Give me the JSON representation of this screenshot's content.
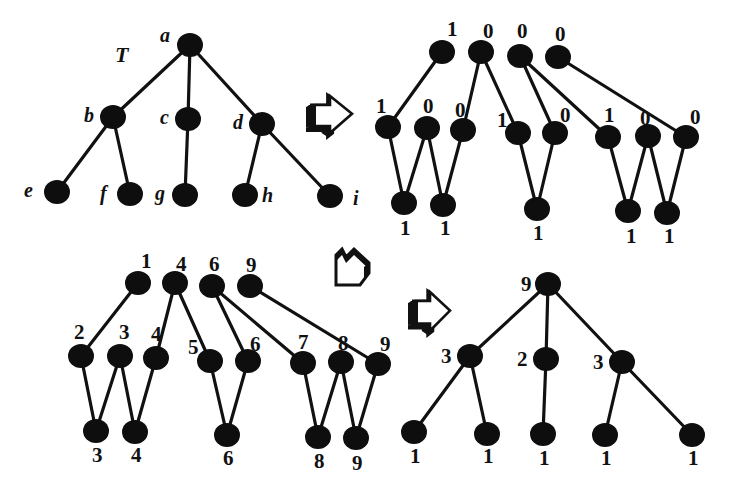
{
  "diagram": {
    "colors": {
      "node": "#0e0e0e",
      "edge": "#111111",
      "background": "#ffffff"
    },
    "node_radius": 12,
    "panels": [
      {
        "id": "tree-T",
        "title": "T",
        "title_pos": [
          115,
          62
        ],
        "label_style": "italic",
        "nodes": [
          {
            "id": "a",
            "x": 190,
            "y": 45,
            "label": "a",
            "lx": 160,
            "ly": 42
          },
          {
            "id": "b",
            "x": 113,
            "y": 117,
            "label": "b",
            "lx": 84,
            "ly": 122
          },
          {
            "id": "c",
            "x": 188,
            "y": 119,
            "label": "c",
            "lx": 160,
            "ly": 124
          },
          {
            "id": "d",
            "x": 262,
            "y": 124,
            "label": "d",
            "lx": 233,
            "ly": 129
          },
          {
            "id": "e",
            "x": 57,
            "y": 192,
            "label": "e",
            "lx": 24,
            "ly": 197
          },
          {
            "id": "f",
            "x": 130,
            "y": 194,
            "label": "f",
            "lx": 100,
            "ly": 200
          },
          {
            "id": "g",
            "x": 185,
            "y": 195,
            "label": "g",
            "lx": 155,
            "ly": 200
          },
          {
            "id": "h",
            "x": 245,
            "y": 195,
            "label": "h",
            "lx": 262,
            "ly": 202
          },
          {
            "id": "i",
            "x": 330,
            "y": 196,
            "label": "i",
            "lx": 353,
            "ly": 205
          }
        ],
        "edges": [
          [
            "a",
            "b"
          ],
          [
            "a",
            "c"
          ],
          [
            "a",
            "d"
          ],
          [
            "b",
            "e"
          ],
          [
            "b",
            "f"
          ],
          [
            "c",
            "g"
          ],
          [
            "d",
            "h"
          ],
          [
            "d",
            "i"
          ]
        ]
      },
      {
        "id": "binary-marks",
        "label_style": "bold",
        "nodes": [
          {
            "id": "t1",
            "x": 442,
            "y": 52,
            "label": "1",
            "lx": 447,
            "ly": 36
          },
          {
            "id": "t2",
            "x": 481,
            "y": 52,
            "label": "0",
            "lx": 483,
            "ly": 38
          },
          {
            "id": "t3",
            "x": 520,
            "y": 56,
            "label": "0",
            "lx": 517,
            "ly": 38
          },
          {
            "id": "t4",
            "x": 558,
            "y": 57,
            "label": "0",
            "lx": 555,
            "ly": 41
          },
          {
            "id": "m1",
            "x": 388,
            "y": 127,
            "label": "1",
            "lx": 376,
            "ly": 113
          },
          {
            "id": "m2",
            "x": 427,
            "y": 128,
            "label": "0",
            "lx": 423,
            "ly": 113
          },
          {
            "id": "m3",
            "x": 463,
            "y": 130,
            "label": "0",
            "lx": 455,
            "ly": 117
          },
          {
            "id": "m4",
            "x": 518,
            "y": 133,
            "label": "1",
            "lx": 497,
            "ly": 127
          },
          {
            "id": "m5",
            "x": 555,
            "y": 133,
            "label": "0",
            "lx": 560,
            "ly": 122
          },
          {
            "id": "m6",
            "x": 608,
            "y": 137,
            "label": "1",
            "lx": 604,
            "ly": 122
          },
          {
            "id": "m7",
            "x": 648,
            "y": 136,
            "label": "0",
            "lx": 640,
            "ly": 125
          },
          {
            "id": "m8",
            "x": 686,
            "y": 137,
            "label": "0",
            "lx": 690,
            "ly": 124
          },
          {
            "id": "b1",
            "x": 404,
            "y": 203,
            "label": "1",
            "lx": 400,
            "ly": 235
          },
          {
            "id": "b2",
            "x": 443,
            "y": 205,
            "label": "1",
            "lx": 440,
            "ly": 235
          },
          {
            "id": "b3",
            "x": 537,
            "y": 209,
            "label": "1",
            "lx": 533,
            "ly": 240
          },
          {
            "id": "b4",
            "x": 628,
            "y": 211,
            "label": "1",
            "lx": 626,
            "ly": 243
          },
          {
            "id": "b5",
            "x": 667,
            "y": 213,
            "label": "1",
            "lx": 664,
            "ly": 243
          }
        ],
        "edges": [
          [
            "t1",
            "m1"
          ],
          [
            "t2",
            "m3"
          ],
          [
            "t2",
            "m4"
          ],
          [
            "t3",
            "m5"
          ],
          [
            "t3",
            "m6"
          ],
          [
            "t4",
            "m8"
          ],
          [
            "m1",
            "b1"
          ],
          [
            "m2",
            "b1"
          ],
          [
            "m2",
            "b2"
          ],
          [
            "m3",
            "b2"
          ],
          [
            "m4",
            "b3"
          ],
          [
            "m5",
            "b3"
          ],
          [
            "m6",
            "b4"
          ],
          [
            "m7",
            "b4"
          ],
          [
            "m7",
            "b5"
          ],
          [
            "m8",
            "b5"
          ]
        ]
      },
      {
        "id": "prefix-sums",
        "label_style": "bold",
        "nodes": [
          {
            "id": "t1",
            "x": 138,
            "y": 283,
            "label": "1",
            "lx": 141,
            "ly": 268
          },
          {
            "id": "t2",
            "x": 175,
            "y": 283,
            "label": "4",
            "lx": 176,
            "ly": 271
          },
          {
            "id": "t3",
            "x": 212,
            "y": 286,
            "label": "6",
            "lx": 209,
            "ly": 271
          },
          {
            "id": "t4",
            "x": 250,
            "y": 286,
            "label": "9",
            "lx": 246,
            "ly": 272
          },
          {
            "id": "m1",
            "x": 81,
            "y": 356,
            "label": "2",
            "lx": 74,
            "ly": 339
          },
          {
            "id": "m2",
            "x": 120,
            "y": 356,
            "label": "3",
            "lx": 119,
            "ly": 339
          },
          {
            "id": "m3",
            "x": 156,
            "y": 358,
            "label": "4",
            "lx": 151,
            "ly": 341
          },
          {
            "id": "m4",
            "x": 210,
            "y": 361,
            "label": "5",
            "lx": 188,
            "ly": 354
          },
          {
            "id": "m5",
            "x": 248,
            "y": 361,
            "label": "6",
            "lx": 250,
            "ly": 351
          },
          {
            "id": "m6",
            "x": 303,
            "y": 363,
            "label": "7",
            "lx": 298,
            "ly": 349
          },
          {
            "id": "m7",
            "x": 341,
            "y": 362,
            "label": "8",
            "lx": 338,
            "ly": 350
          },
          {
            "id": "m8",
            "x": 378,
            "y": 364,
            "label": "9",
            "lx": 380,
            "ly": 351
          },
          {
            "id": "b1",
            "x": 96,
            "y": 431,
            "label": "3",
            "lx": 92,
            "ly": 462
          },
          {
            "id": "b2",
            "x": 135,
            "y": 432,
            "label": "4",
            "lx": 131,
            "ly": 462
          },
          {
            "id": "b3",
            "x": 227,
            "y": 435,
            "label": "6",
            "lx": 223,
            "ly": 465
          },
          {
            "id": "b4",
            "x": 318,
            "y": 437,
            "label": "8",
            "lx": 314,
            "ly": 468
          },
          {
            "id": "b5",
            "x": 356,
            "y": 438,
            "label": "9",
            "lx": 352,
            "ly": 470
          }
        ],
        "edges": [
          [
            "t1",
            "m1"
          ],
          [
            "t2",
            "m3"
          ],
          [
            "t2",
            "m4"
          ],
          [
            "t3",
            "m5"
          ],
          [
            "t3",
            "m6"
          ],
          [
            "t4",
            "m8"
          ],
          [
            "m1",
            "b1"
          ],
          [
            "m2",
            "b1"
          ],
          [
            "m2",
            "b2"
          ],
          [
            "m3",
            "b2"
          ],
          [
            "m4",
            "b3"
          ],
          [
            "m5",
            "b3"
          ],
          [
            "m6",
            "b4"
          ],
          [
            "m7",
            "b4"
          ],
          [
            "m7",
            "b5"
          ],
          [
            "m8",
            "b5"
          ]
        ]
      },
      {
        "id": "subtree-sizes",
        "label_style": "bold",
        "nodes": [
          {
            "id": "r",
            "x": 548,
            "y": 284,
            "label": "9",
            "lx": 521,
            "ly": 291
          },
          {
            "id": "x1",
            "x": 470,
            "y": 356,
            "label": "3",
            "lx": 441,
            "ly": 363
          },
          {
            "id": "x2",
            "x": 546,
            "y": 359,
            "label": "2",
            "lx": 517,
            "ly": 366
          },
          {
            "id": "x3",
            "x": 622,
            "y": 362,
            "label": "3",
            "lx": 593,
            "ly": 369
          },
          {
            "id": "l1",
            "x": 414,
            "y": 432,
            "label": "1",
            "lx": 410,
            "ly": 463
          },
          {
            "id": "l2",
            "x": 487,
            "y": 434,
            "label": "1",
            "lx": 483,
            "ly": 463
          },
          {
            "id": "l3",
            "x": 543,
            "y": 434,
            "label": "1",
            "lx": 539,
            "ly": 465
          },
          {
            "id": "l4",
            "x": 605,
            "y": 435,
            "label": "1",
            "lx": 601,
            "ly": 465
          },
          {
            "id": "l5",
            "x": 692,
            "y": 435,
            "label": "1",
            "lx": 688,
            "ly": 465
          }
        ],
        "edges": [
          [
            "r",
            "x1"
          ],
          [
            "r",
            "x2"
          ],
          [
            "r",
            "x3"
          ],
          [
            "x1",
            "l1"
          ],
          [
            "x1",
            "l2"
          ],
          [
            "x2",
            "l3"
          ],
          [
            "x3",
            "l4"
          ],
          [
            "x3",
            "l5"
          ]
        ]
      }
    ],
    "arrows": [
      {
        "id": "arrow-1",
        "direction": "right",
        "x": 306,
        "y": 93,
        "w": 48,
        "h": 46
      },
      {
        "id": "arrow-2",
        "direction": "down-left",
        "x": 332,
        "y": 245,
        "w": 40,
        "h": 46
      },
      {
        "id": "arrow-3",
        "direction": "right",
        "x": 408,
        "y": 289,
        "w": 44,
        "h": 48
      }
    ]
  }
}
